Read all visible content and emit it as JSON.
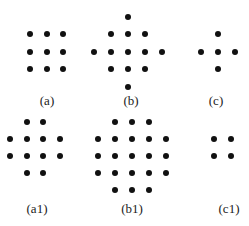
{
  "figure": {
    "dot_color": "#111111",
    "label_color": "#222222",
    "panels": [
      {
        "id": "a",
        "label": "(a)",
        "label_pos": [
          47,
          101
        ],
        "dots": [
          [
            30,
            34
          ],
          [
            47,
            34
          ],
          [
            63,
            34
          ],
          [
            30,
            52
          ],
          [
            47,
            52
          ],
          [
            63,
            52
          ],
          [
            30,
            69
          ],
          [
            47,
            69
          ],
          [
            63,
            69
          ]
        ]
      },
      {
        "id": "b",
        "label": "(b)",
        "label_pos": [
          131,
          101
        ],
        "dots": [
          [
            128,
            17
          ],
          [
            111,
            34
          ],
          [
            128,
            34
          ],
          [
            145,
            34
          ],
          [
            94,
            52
          ],
          [
            111,
            52
          ],
          [
            128,
            52
          ],
          [
            145,
            52
          ],
          [
            162,
            52
          ],
          [
            111,
            69
          ],
          [
            128,
            69
          ],
          [
            145,
            69
          ],
          [
            128,
            87
          ]
        ]
      },
      {
        "id": "c",
        "label": "(c)",
        "label_pos": [
          216,
          101
        ],
        "dots": [
          [
            218,
            34
          ],
          [
            201,
            52
          ],
          [
            218,
            52
          ],
          [
            235,
            52
          ],
          [
            218,
            69
          ]
        ]
      },
      {
        "id": "a1",
        "label": "(a1)",
        "label_pos": [
          37,
          209
        ],
        "dots": [
          [
            27,
            122
          ],
          [
            43,
            122
          ],
          [
            10,
            139
          ],
          [
            27,
            139
          ],
          [
            43,
            139
          ],
          [
            60,
            139
          ],
          [
            10,
            156
          ],
          [
            27,
            156
          ],
          [
            43,
            156
          ],
          [
            60,
            156
          ],
          [
            27,
            173
          ],
          [
            43,
            173
          ]
        ]
      },
      {
        "id": "b1",
        "label": "(b1)",
        "label_pos": [
          132,
          209
        ],
        "dots": [
          [
            115,
            122
          ],
          [
            132,
            122
          ],
          [
            149,
            122
          ],
          [
            98,
            139
          ],
          [
            115,
            139
          ],
          [
            132,
            139
          ],
          [
            149,
            139
          ],
          [
            166,
            139
          ],
          [
            98,
            156
          ],
          [
            115,
            156
          ],
          [
            132,
            156
          ],
          [
            149,
            156
          ],
          [
            166,
            156
          ],
          [
            98,
            173
          ],
          [
            115,
            173
          ],
          [
            132,
            173
          ],
          [
            149,
            173
          ],
          [
            166,
            173
          ],
          [
            115,
            190
          ],
          [
            132,
            190
          ],
          [
            149,
            190
          ]
        ]
      },
      {
        "id": "c1",
        "label": "(c1)",
        "label_pos": [
          229,
          209
        ],
        "dots": [
          [
            214,
            139
          ],
          [
            231,
            139
          ],
          [
            214,
            156
          ],
          [
            231,
            156
          ]
        ]
      }
    ]
  }
}
